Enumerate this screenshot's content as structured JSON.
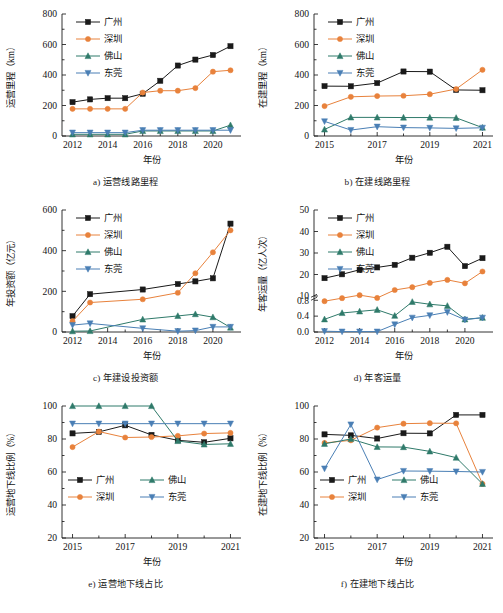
{
  "figure": {
    "width": 503,
    "height": 613,
    "background": "#ffffff"
  },
  "colors": {
    "guangzhou": "#1a1a1a",
    "shenzhen": "#e8823c",
    "foshan": "#2f7a6a",
    "dongguan": "#4a7fb5"
  },
  "series_names": {
    "guangzhou": "广州",
    "shenzhen": "深圳",
    "foshan": "佛山",
    "dongguan": "东莞"
  },
  "markers": {
    "guangzhou": "square",
    "shenzhen": "circle",
    "foshan": "triangle-up",
    "dongguan": "triangle-down"
  },
  "common": {
    "xlabel": "年份"
  },
  "chart_data": [
    {
      "id": "a",
      "type": "line",
      "caption": "a) 运营线路里程",
      "title": "",
      "xlabel": "年份",
      "ylabel": "运营里程（km）",
      "x": [
        2012,
        2013,
        2014,
        2015,
        2016,
        2017,
        2018,
        2019,
        2020,
        2021
      ],
      "xlim": [
        2011.4,
        2021.6
      ],
      "xticks": [
        2012,
        2014,
        2016,
        2018,
        2020
      ],
      "xticklabels": [
        "2012",
        "2014",
        "2016",
        "2018",
        "2020"
      ],
      "ylim": [
        0,
        800
      ],
      "yticks": [
        0,
        200,
        400,
        600,
        800
      ],
      "yticklabels": [
        "0",
        "200",
        "400",
        "600",
        "800"
      ],
      "grid": false,
      "legend_position": "upper-left",
      "legend_columns": 1,
      "series": [
        {
          "name": "广州",
          "key": "guangzhou",
          "values": [
            222,
            240,
            248,
            248,
            277,
            362,
            462,
            501,
            531,
            589
          ]
        },
        {
          "name": "深圳",
          "key": "shenzhen",
          "values": [
            178,
            178,
            178,
            178,
            285,
            297,
            297,
            314,
            422,
            431
          ]
        },
        {
          "name": "佛山",
          "key": "foshan",
          "values": [
            11,
            11,
            11,
            11,
            33,
            33,
            33,
            33,
            33,
            71
          ]
        },
        {
          "name": "东莞",
          "key": "dongguan",
          "values": [
            22,
            22,
            22,
            22,
            38,
            38,
            38,
            38,
            38,
            38
          ]
        }
      ]
    },
    {
      "id": "b",
      "type": "line",
      "caption": "b) 在建线路里程",
      "title": "",
      "xlabel": "年份",
      "ylabel": "在建里程（km）",
      "x": [
        2015,
        2016,
        2017,
        2018,
        2019,
        2020,
        2021
      ],
      "xlim": [
        2014.6,
        2021.4
      ],
      "xticks": [
        2015,
        2017,
        2019,
        2021
      ],
      "xticklabels": [
        "2015",
        "2017",
        "2019",
        "2021"
      ],
      "ylim": [
        0,
        800
      ],
      "yticks": [
        0,
        200,
        400,
        600,
        800
      ],
      "yticklabels": [
        "0",
        "200",
        "400",
        "600",
        "800"
      ],
      "grid": false,
      "legend_position": "upper-left",
      "legend_columns": 1,
      "series": [
        {
          "name": "广州",
          "key": "guangzhou",
          "values": [
            327,
            326,
            347,
            423,
            422,
            302,
            300
          ]
        },
        {
          "name": "深圳",
          "key": "shenzhen",
          "values": [
            196,
            257,
            262,
            264,
            274,
            308,
            434
          ]
        },
        {
          "name": "佛山",
          "key": "foshan",
          "values": [
            43,
            122,
            122,
            121,
            121,
            119,
            55
          ]
        },
        {
          "name": "东莞",
          "key": "dongguan",
          "values": [
            96,
            39,
            61,
            55,
            53,
            50,
            54
          ]
        }
      ]
    },
    {
      "id": "c",
      "type": "line",
      "caption": "c) 年建设投资额",
      "title": "",
      "xlabel": "年份",
      "ylabel": "年投资额（亿元）",
      "x": [
        2012,
        2013,
        2016,
        2018,
        2019,
        2020,
        2021
      ],
      "xlim": [
        2011.4,
        2021.6
      ],
      "xticks": [
        2012,
        2014,
        2016,
        2018,
        2020
      ],
      "xticklabels": [
        "2012",
        "2014",
        "2016",
        "2018",
        "2020"
      ],
      "ylim": [
        0,
        600
      ],
      "yticks": [
        0,
        200,
        400,
        600
      ],
      "yticklabels": [
        "0",
        "200",
        "400",
        "600"
      ],
      "grid": false,
      "legend_position": "upper-left",
      "legend_columns": 1,
      "series": [
        {
          "name": "广州",
          "key": "guangzhou",
          "values": [
            78,
            186,
            209,
            236,
            249,
            264,
            533
          ]
        },
        {
          "name": "深圳",
          "key": "shenzhen",
          "values": [
            53,
            145,
            161,
            193,
            289,
            392,
            500
          ]
        },
        {
          "name": "佛山",
          "key": "foshan",
          "values": [
            4,
            5,
            62,
            79,
            88,
            73,
            22
          ]
        },
        {
          "name": "东莞",
          "key": "dongguan",
          "values": [
            34,
            42,
            18,
            4,
            7,
            25,
            25
          ]
        }
      ]
    },
    {
      "id": "d",
      "type": "line",
      "caption": "d) 年客运量",
      "title": "",
      "xlabel": "年份",
      "ylabel": "年客运量（亿人次）",
      "axis_break": true,
      "lower_range": [
        0.0,
        0.8
      ],
      "upper_range": [
        10,
        50
      ],
      "x": [
        2012,
        2013,
        2014,
        2015,
        2016,
        2017,
        2018,
        2019,
        2020,
        2021
      ],
      "xlim": [
        2011.4,
        2021.6
      ],
      "xticks": [
        2012,
        2014,
        2016,
        2018,
        2020
      ],
      "xticklabels": [
        "2012",
        "2014",
        "2016",
        "2018",
        "2020"
      ],
      "yticks": [
        0.0,
        0.4,
        0.8,
        10,
        20,
        30,
        40,
        50
      ],
      "yticklabels": [
        "0.0",
        "0.4",
        "0.8",
        "10",
        "20",
        "30",
        "40",
        "50"
      ],
      "grid": false,
      "legend_position": "upper-left",
      "legend_columns": 1,
      "series": [
        {
          "name": "广州",
          "key": "guangzhou",
          "values": [
            18.3,
            20.1,
            22.2,
            23.3,
            24.5,
            27.8,
            30.1,
            32.9,
            23.9,
            27.6
          ]
        },
        {
          "name": "深圳",
          "key": "shenzhen",
          "values": [
            7.6,
            9.0,
            10.4,
            9.1,
            12.8,
            14.1,
            16.1,
            17.5,
            15.9,
            21.4
          ]
        },
        {
          "name": "佛山",
          "key": "foshan",
          "values": [
            0.32,
            0.48,
            0.52,
            0.56,
            0.82,
            0.76,
            0.7,
            0.66,
            0.32,
            0.36
          ]
        },
        {
          "name": "东莞",
          "key": "dongguan",
          "values": [
            0.02,
            0.01,
            0.01,
            0.01,
            0.19,
            0.36,
            0.42,
            0.5,
            0.31,
            0.36
          ]
        }
      ]
    },
    {
      "id": "e",
      "type": "line",
      "caption": "e) 运营地下线占比",
      "title": "",
      "xlabel": "年份",
      "ylabel": "运营地下线比例（%）",
      "x": [
        2015,
        2016,
        2017,
        2018,
        2019,
        2020,
        2021
      ],
      "xlim": [
        2014.6,
        2021.4
      ],
      "xticks": [
        2015,
        2017,
        2019,
        2021
      ],
      "xticklabels": [
        "2015",
        "2017",
        "2019",
        "2021"
      ],
      "ylim": [
        20,
        100
      ],
      "yticks": [
        20,
        40,
        60,
        80,
        100
      ],
      "yticklabels": [
        "20",
        "40",
        "60",
        "80",
        "100"
      ],
      "grid": false,
      "legend_position": "lower-left",
      "legend_columns": 2,
      "series": [
        {
          "name": "广州",
          "key": "guangzhou",
          "values": [
            83.4,
            84.3,
            88.3,
            82.5,
            79.2,
            78.0,
            80.4
          ]
        },
        {
          "name": "深圳",
          "key": "shenzhen",
          "values": [
            75.1,
            84.5,
            80.9,
            81.2,
            81.9,
            83.3,
            83.7
          ]
        },
        {
          "name": "佛山",
          "key": "foshan",
          "values": [
            100,
            100,
            100,
            100,
            78.8,
            76.7,
            77.1
          ]
        },
        {
          "name": "东莞",
          "key": "dongguan",
          "values": [
            89.3,
            89.3,
            89.3,
            89.3,
            89.3,
            89.3,
            89.3
          ]
        }
      ]
    },
    {
      "id": "f",
      "type": "line",
      "caption": "f) 在建地下线占比",
      "title": "",
      "xlabel": "年份",
      "ylabel": "在建地下线比例（%）",
      "x": [
        2015,
        2016,
        2017,
        2018,
        2019,
        2020,
        2021
      ],
      "xlim": [
        2014.6,
        2021.4
      ],
      "xticks": [
        2015,
        2017,
        2019,
        2021
      ],
      "xticklabels": [
        "2015",
        "2017",
        "2019",
        "2021"
      ],
      "ylim": [
        20,
        100
      ],
      "yticks": [
        20,
        40,
        60,
        80,
        100
      ],
      "yticklabels": [
        "20",
        "40",
        "60",
        "80",
        "100"
      ],
      "grid": false,
      "legend_position": "lower-left",
      "legend_columns": 2,
      "series": [
        {
          "name": "广州",
          "key": "guangzhou",
          "values": [
            82.8,
            82.2,
            80.3,
            83.5,
            83.4,
            94.6,
            94.6
          ]
        },
        {
          "name": "深圳",
          "key": "shenzhen",
          "values": [
            77.6,
            79.2,
            86.9,
            89.3,
            89.6,
            89.5,
            52.8
          ]
        },
        {
          "name": "佛山",
          "key": "foshan",
          "values": [
            77.1,
            80.0,
            75.2,
            75.1,
            72.5,
            68.7,
            52.8
          ]
        },
        {
          "name": "东莞",
          "key": "dongguan",
          "values": [
            62.1,
            88.8,
            55.4,
            60.6,
            60.5,
            60.3,
            60.0
          ]
        }
      ]
    }
  ]
}
